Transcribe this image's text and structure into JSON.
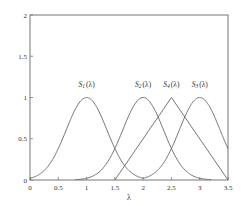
{
  "chart_data": {
    "type": "line",
    "title": "",
    "xlabel": "λ",
    "ylabel": "",
    "xlim": [
      0,
      3.5
    ],
    "ylim": [
      0,
      2
    ],
    "xticks": [
      0,
      0.5,
      1,
      1.5,
      2,
      2.5,
      3,
      3.5
    ],
    "xtick_labels": [
      "0",
      "0.5",
      "1",
      "1.5",
      "2",
      "2.5",
      "3",
      "3.5"
    ],
    "yticks": [
      0,
      0.5,
      1,
      1.5,
      2
    ],
    "ytick_labels": [
      "0",
      "0.5",
      "1",
      "1.5",
      "2"
    ],
    "grid": false,
    "legend": "none",
    "series": [
      {
        "name": "S1(λ)",
        "label_base": "S",
        "label_sub": "1",
        "label_arg": "(λ)",
        "shape": "gaussian",
        "center": 1.0,
        "sigma": 0.36,
        "peak": 1.0,
        "x": [
          0,
          0.25,
          0.5,
          0.75,
          1.0,
          1.25,
          1.5,
          1.75,
          2.0
        ],
        "values": [
          0.02,
          0.12,
          0.38,
          0.79,
          1.0,
          0.79,
          0.38,
          0.12,
          0.02
        ],
        "label_at": [
          1.0,
          1.13
        ]
      },
      {
        "name": "S2(λ)",
        "label_base": "S",
        "label_sub": "2",
        "label_arg": "(λ)",
        "shape": "gaussian",
        "center": 2.0,
        "sigma": 0.36,
        "peak": 1.0,
        "x": [
          0.8,
          1.0,
          1.25,
          1.5,
          1.75,
          2.0,
          2.25,
          2.5,
          2.75,
          3.0,
          3.2
        ],
        "values": [
          0.0,
          0.02,
          0.12,
          0.38,
          0.79,
          1.0,
          0.79,
          0.38,
          0.12,
          0.02,
          0.0
        ],
        "label_at": [
          2.0,
          1.13
        ]
      },
      {
        "name": "S4(λ)",
        "label_base": "S",
        "label_sub": "4",
        "label_arg": "(λ)",
        "shape": "triangle",
        "start": 1.5,
        "center": 2.5,
        "end": 3.5,
        "peak": 1.0,
        "x": [
          1.5,
          2.5,
          3.5
        ],
        "values": [
          0.0,
          1.0,
          0.0
        ],
        "label_at": [
          2.5,
          1.13
        ]
      },
      {
        "name": "S3(λ)",
        "label_base": "S",
        "label_sub": "3",
        "label_arg": "(λ)",
        "shape": "gaussian",
        "center": 3.0,
        "sigma": 0.36,
        "peak": 1.0,
        "x": [
          2.0,
          2.25,
          2.5,
          2.75,
          3.0,
          3.25,
          3.5
        ],
        "values": [
          0.02,
          0.12,
          0.38,
          0.79,
          1.0,
          0.79,
          0.38
        ],
        "label_at": [
          3.0,
          1.13
        ]
      }
    ]
  }
}
